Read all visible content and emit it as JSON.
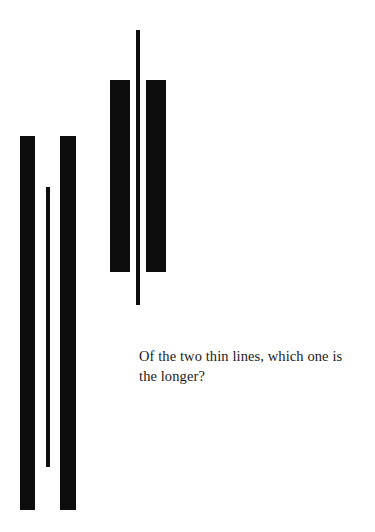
{
  "page": {
    "background_color": "#ffffff",
    "ink_color": "#0d0d0d",
    "width": 375,
    "height": 532
  },
  "caption": {
    "text": "Of the two thin lines, which one is\nthe longer?",
    "line_1": "Of the two thin lines, which one is",
    "line_2": "the longer?",
    "color": "#1a1a1a"
  },
  "figure": {
    "left_group": {
      "name": "left-figure-group",
      "description": "Thin line shorter than flanking bars",
      "bars": [
        {
          "name": "left-outer-bar",
          "x": 20,
          "y": 136,
          "width": 15,
          "height": 374
        },
        {
          "name": "left-inner-bar",
          "x": 60,
          "y": 136,
          "width": 16,
          "height": 374
        }
      ],
      "thin_line": {
        "name": "left-thin-line",
        "x": 46,
        "y": 187,
        "width": 4,
        "height": 280
      }
    },
    "right_group": {
      "name": "right-figure-group",
      "description": "Thin line longer than flanking bars",
      "bars": [
        {
          "name": "right-outer-bar",
          "x": 110,
          "y": 80,
          "width": 20,
          "height": 192
        },
        {
          "name": "right-inner-bar",
          "x": 146,
          "y": 80,
          "width": 20,
          "height": 192
        }
      ],
      "thin_line": {
        "name": "right-thin-line",
        "x": 136,
        "y": 30,
        "width": 4,
        "height": 275
      }
    }
  }
}
